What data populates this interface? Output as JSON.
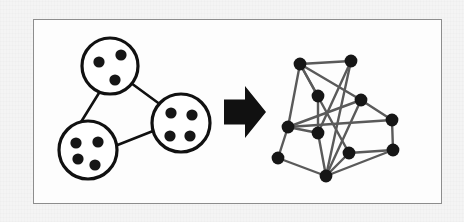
{
  "figure": {
    "caption": "",
    "frame": {
      "x": 33,
      "y": 19,
      "width": 409,
      "height": 185,
      "border_color": "#8d8d8d",
      "fill": "#fdfdfd"
    },
    "canvas": {
      "width": 464,
      "height": 222,
      "background": "#f3f3f3"
    },
    "palette": {
      "ink": "#111111",
      "node_fill": "#161616",
      "edge_stroke": "#5a5a5a",
      "cluster_stroke": "#111111",
      "cluster_fill": "#ffffff",
      "arrow_fill": "#111111",
      "frame_border": "#8d8d8d",
      "paper": "#fdfdfd"
    }
  },
  "left_panel": {
    "label": "clustered graph",
    "cluster_stroke_width": 3.2,
    "connector_stroke_width": 2.6,
    "member_dot_radius": 5.6,
    "clusters": [
      {
        "id": "cluster-top",
        "name": "cluster-top",
        "cx": 110,
        "cy": 66,
        "r": 28,
        "member_count": 3,
        "members": [
          {
            "cx": 99,
            "cy": 62
          },
          {
            "cx": 121,
            "cy": 55
          },
          {
            "cx": 115,
            "cy": 80
          }
        ]
      },
      {
        "id": "cluster-bottom-left",
        "name": "cluster-bottom-left",
        "cx": 88,
        "cy": 150,
        "r": 29,
        "member_count": 4,
        "members": [
          {
            "cx": 76,
            "cy": 143
          },
          {
            "cx": 98,
            "cy": 142
          },
          {
            "cx": 78,
            "cy": 159
          },
          {
            "cx": 95,
            "cy": 165
          }
        ]
      },
      {
        "id": "cluster-right",
        "name": "cluster-right",
        "cx": 181,
        "cy": 123,
        "r": 29,
        "member_count": 4,
        "members": [
          {
            "cx": 171,
            "cy": 113
          },
          {
            "cx": 192,
            "cy": 115
          },
          {
            "cx": 170,
            "cy": 136
          },
          {
            "cx": 190,
            "cy": 136
          }
        ]
      }
    ],
    "connectors": [
      {
        "from": "cluster-top",
        "to": "cluster-bottom-left",
        "x1": 99,
        "y1": 93,
        "x2": 81,
        "y2": 122
      },
      {
        "from": "cluster-top",
        "to": "cluster-right",
        "x1": 131,
        "y1": 83,
        "x2": 161,
        "y2": 105
      },
      {
        "from": "cluster-bottom-left",
        "to": "cluster-right",
        "x1": 115,
        "y1": 146,
        "x2": 153,
        "y2": 131
      }
    ]
  },
  "arrow": {
    "name": "right-arrow",
    "label": "expands to",
    "x": 224,
    "y": 86,
    "width": 42,
    "height": 52
  },
  "right_panel": {
    "label": "expanded graph",
    "node_radius": 6.4,
    "edge_stroke_width": 2.4,
    "node_count": 11,
    "edge_count": 19,
    "nodes": [
      {
        "id": "n1",
        "name": "node-top-left",
        "cx": 300,
        "cy": 64
      },
      {
        "id": "n2",
        "name": "node-top-right",
        "cx": 351,
        "cy": 61
      },
      {
        "id": "n3",
        "name": "node-upper-mid",
        "cx": 318,
        "cy": 96
      },
      {
        "id": "n4",
        "name": "node-mid-right",
        "cx": 361,
        "cy": 100
      },
      {
        "id": "n5",
        "name": "node-mid-left",
        "cx": 288,
        "cy": 127
      },
      {
        "id": "n6",
        "name": "node-center",
        "cx": 318,
        "cy": 133
      },
      {
        "id": "n7",
        "name": "node-far-right",
        "cx": 392,
        "cy": 120
      },
      {
        "id": "n8",
        "name": "node-bottom-left",
        "cx": 278,
        "cy": 158
      },
      {
        "id": "n9",
        "name": "node-bottom-center",
        "cx": 326,
        "cy": 176
      },
      {
        "id": "n10",
        "name": "node-bottom-mid-right",
        "cx": 349,
        "cy": 153
      },
      {
        "id": "n11",
        "name": "node-bottom-right",
        "cx": 393,
        "cy": 150
      }
    ],
    "edges": [
      {
        "from": "n1",
        "to": "n2"
      },
      {
        "from": "n1",
        "to": "n3"
      },
      {
        "from": "n1",
        "to": "n5"
      },
      {
        "from": "n1",
        "to": "n4"
      },
      {
        "from": "n1",
        "to": "n10"
      },
      {
        "from": "n2",
        "to": "n6"
      },
      {
        "from": "n2",
        "to": "n9"
      },
      {
        "from": "n3",
        "to": "n6"
      },
      {
        "from": "n4",
        "to": "n5"
      },
      {
        "from": "n4",
        "to": "n7"
      },
      {
        "from": "n4",
        "to": "n9"
      },
      {
        "from": "n5",
        "to": "n6"
      },
      {
        "from": "n5",
        "to": "n8"
      },
      {
        "from": "n5",
        "to": "n7"
      },
      {
        "from": "n6",
        "to": "n9"
      },
      {
        "from": "n7",
        "to": "n11"
      },
      {
        "from": "n8",
        "to": "n9"
      },
      {
        "from": "n9",
        "to": "n10"
      },
      {
        "from": "n9",
        "to": "n11"
      },
      {
        "from": "n10",
        "to": "n11"
      }
    ]
  }
}
